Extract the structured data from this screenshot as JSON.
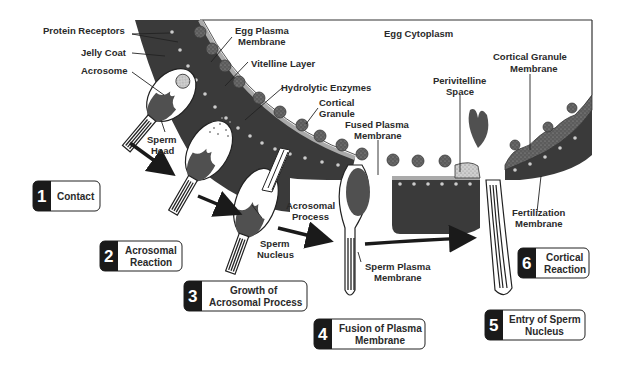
{
  "diagram": {
    "colors": {
      "jelly_coat": "#3a3a3a",
      "granule": "#6a6a6a",
      "membrane_gray": "#9a9a9a",
      "nucleus": "#505050",
      "background": "#ffffff",
      "step_box_dark": "#1a1a1a"
    },
    "labels": {
      "protein_receptors": "Protein Receptors",
      "jelly_coat": "Jelly Coat",
      "acrosome": "Acrosome",
      "sperm_head_1": "Sperm",
      "sperm_head_2": "Head",
      "egg_plasma_membrane_1": "Egg Plasma",
      "egg_plasma_membrane_2": "Membrane",
      "vitelline_layer": "Vitelline Layer",
      "hydrolytic_enzymes": "Hydrolytic Enzymes",
      "cortical_granule_1": "Cortical",
      "cortical_granule_2": "Granule",
      "egg_cytoplasm": "Egg Cytoplasm",
      "fused_plasma_membrane_1": "Fused Plasma",
      "fused_plasma_membrane_2": "Membrane",
      "perivitelline_space_1": "Perivitelline",
      "perivitelline_space_2": "Space",
      "cortical_granule_membrane_1": "Cortical Granule",
      "cortical_granule_membrane_2": "Membrane",
      "acrosomal_process_1": "Acrosomal",
      "acrosomal_process_2": "Process",
      "sperm_nucleus_1": "Sperm",
      "sperm_nucleus_2": "Nucleus",
      "sperm_plasma_membrane_1": "Sperm Plasma",
      "sperm_plasma_membrane_2": "Membrane",
      "fertilization_membrane_1": "Fertilization",
      "fertilization_membrane_2": "Membrane"
    },
    "steps": [
      {
        "number": "1",
        "line1": "Contact",
        "line2": ""
      },
      {
        "number": "2",
        "line1": "Acrosomal",
        "line2": "Reaction"
      },
      {
        "number": "3",
        "line1": "Growth of",
        "line2": "Acrosomal Process"
      },
      {
        "number": "4",
        "line1": "Fusion of Plasma",
        "line2": "Membrane"
      },
      {
        "number": "5",
        "line1": "Entry of Sperm",
        "line2": "Nucleus"
      },
      {
        "number": "6",
        "line1": "Cortical",
        "line2": "Reaction"
      }
    ]
  }
}
